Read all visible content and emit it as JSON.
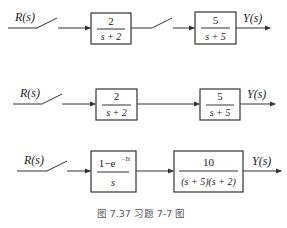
{
  "rows": [
    {
      "input_label": "R(s)",
      "output_label": "Y(s)",
      "blocks": [
        {
          "numerator": "2",
          "denominator": "s + 2"
        },
        {
          "numerator": "5",
          "denominator": "s + 5"
        }
      ],
      "samplers": 2
    },
    {
      "input_label": "R(s)",
      "output_label": "Y(s)",
      "blocks": [
        {
          "numerator": "2",
          "denominator": "s + 2"
        },
        {
          "numerator": "5",
          "denominator": "s + 5"
        }
      ],
      "samplers": 1
    },
    {
      "input_label": "R(s)",
      "output_label": "Y(s)",
      "blocks": [
        {
          "numerator": "1−e",
          "numerator_sup": "−Ts",
          "denominator": "s"
        },
        {
          "numerator": "10",
          "denominator": "(s + 5)(s + 2)"
        }
      ],
      "samplers": 1
    }
  ],
  "caption": "图 7.37    习题 7-7 图"
}
